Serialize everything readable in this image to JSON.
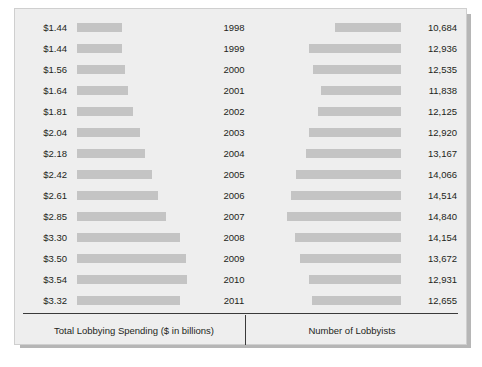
{
  "panel": {
    "background_color": "#eeeeee",
    "bar_color": "#c4c4c4",
    "text_color": "#231f20",
    "rule_color": "#3a3a3a"
  },
  "footer": {
    "left_label": "Total Lobbying Spending ($ in billions)",
    "right_label": "Number of Lobbyists"
  },
  "chart_data": {
    "type": "bar",
    "title": "",
    "subtitle": "",
    "orientation": "horizontal",
    "layout": "back-to-back paired bars with centered year labels",
    "grid": false,
    "legend": false,
    "categories": [
      "1998",
      "1999",
      "2000",
      "2001",
      "2002",
      "2003",
      "2004",
      "2005",
      "2006",
      "2007",
      "2008",
      "2009",
      "2010",
      "2011"
    ],
    "xlabel": "",
    "ylabel": "",
    "series": [
      {
        "name": "Total Lobbying Spending ($ in billions)",
        "side": "left",
        "unit": "$ billions",
        "max": 3.54,
        "values": [
          1.44,
          1.44,
          1.56,
          1.64,
          1.81,
          2.04,
          2.18,
          2.42,
          2.61,
          2.85,
          3.3,
          3.5,
          3.54,
          3.32
        ],
        "labels": [
          "$1.44",
          "$1.44",
          "$1.56",
          "$1.64",
          "$1.81",
          "$2.04",
          "$2.18",
          "$2.42",
          "$2.61",
          "$2.85",
          "$3.30",
          "$3.50",
          "$3.54",
          "$3.32"
        ]
      },
      {
        "name": "Number of Lobbyists",
        "side": "right",
        "unit": "lobbyists",
        "max": 14840,
        "values": [
          10684,
          12936,
          12535,
          11838,
          12125,
          12920,
          13167,
          14066,
          14514,
          14840,
          14154,
          13672,
          12931,
          12655
        ],
        "labels": [
          "10,684",
          "12,936",
          "12,535",
          "11,838",
          "12,125",
          "12,920",
          "13,167",
          "14,066",
          "14,514",
          "14,840",
          "14,154",
          "13,672",
          "12,931",
          "12,655"
        ]
      }
    ]
  }
}
